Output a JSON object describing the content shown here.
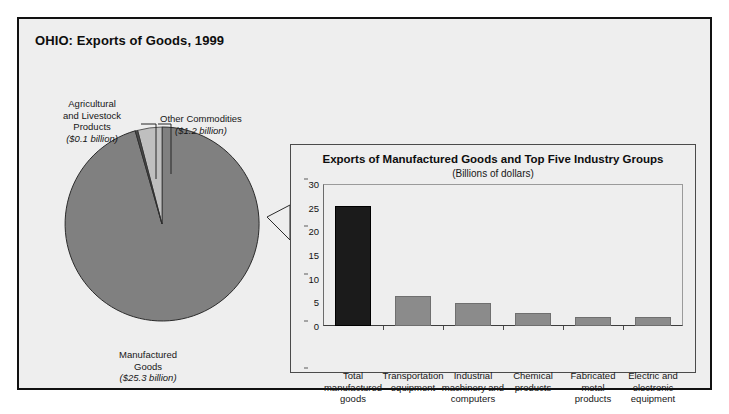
{
  "figure": {
    "title": "OHIO: Exports of Goods, 1999"
  },
  "pie": {
    "labels": {
      "agricultural": {
        "name": "Agricultural\nand Livestock\nProducts",
        "line1": "Agricultural",
        "line2": "and Livestock",
        "line3": "Products",
        "amount": "($0.1 billion)"
      },
      "other": {
        "line1": "Other Commodities",
        "amount": "($1.2 billion)"
      },
      "manufactured": {
        "line1": "Manufactured",
        "line2": "Goods",
        "amount": "($25.3 billion)"
      }
    }
  },
  "inset": {
    "title": "Exports of Manufactured Goods and Top Five Industry Groups",
    "subtitle": "(Billions of dollars)"
  },
  "colors": {
    "pie_manufactured": "#808080",
    "pie_other": "#bfbfbf",
    "pie_agricultural": "#4a4a4a",
    "bar_total": "#1b1b1b",
    "bar_group": "#8b8b8b",
    "panel_background": "#eeeeee",
    "frame": "#111111"
  },
  "chart_data": [
    {
      "type": "pie",
      "title": "OHIO: Exports of Goods, 1999",
      "unit": "Billions of dollars",
      "labels": [
        "Manufactured Goods",
        "Other Commodities",
        "Agricultural and Livestock Products"
      ],
      "values": [
        25.3,
        1.2,
        0.1
      ],
      "value_labels": [
        "($25.3 billion)",
        "($1.2 billion)",
        "($0.1 billion)"
      ],
      "legend": "none"
    },
    {
      "type": "bar",
      "title": "Exports of Manufactured Goods and Top Five Industry Groups",
      "subtitle": "(Billions of dollars)",
      "xlabel": "",
      "ylabel": "",
      "ylim": [
        0,
        30
      ],
      "yticks": [
        0,
        5,
        10,
        15,
        20,
        25,
        30
      ],
      "grid": false,
      "legend": "none",
      "categories": [
        "Total manufactured goods",
        "Transportation equipment",
        "Industrial machinery and computers",
        "Chemical products",
        "Fabricated metal products",
        "Electric and electronic equipment"
      ],
      "category_lines": [
        [
          "Total",
          "manufactured",
          "goods"
        ],
        [
          "Transportation",
          "equipment"
        ],
        [
          "Industrial",
          "machinery and",
          "computers"
        ],
        [
          "Chemical",
          "products"
        ],
        [
          "Fabricated",
          "metal",
          "products"
        ],
        [
          "Electric and",
          "electronic",
          "equipment"
        ]
      ],
      "values": [
        25.3,
        6.3,
        4.8,
        2.7,
        1.8,
        1.8
      ]
    }
  ]
}
